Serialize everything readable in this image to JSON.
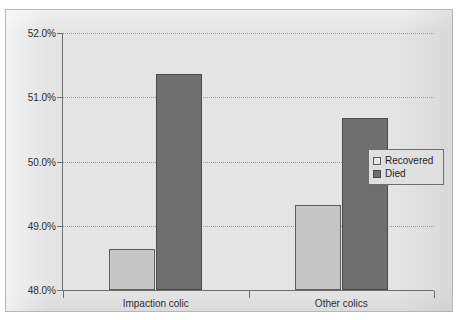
{
  "chart_data": {
    "type": "bar",
    "title": "",
    "subtitle": "",
    "xlabel": "",
    "ylabel": "",
    "categories": [
      "Impaction colic",
      "Other colics"
    ],
    "series": [
      {
        "name": "Recovered",
        "color": "#c6c6c6",
        "values": [
          48.64,
          49.32
        ]
      },
      {
        "name": "Died",
        "color": "#6f6f6f",
        "values": [
          51.36,
          50.68
        ]
      }
    ],
    "ylim": [
      48.0,
      52.0
    ],
    "ytick_step": 1.0,
    "ytick_labels": [
      "52.0%",
      "51.0%",
      "50.0%",
      "49.0%",
      "48.0%"
    ],
    "ytick_values": [
      52.0,
      51.0,
      50.0,
      49.0,
      48.0
    ],
    "grid": true,
    "grid_style": "dotted-horizontal",
    "legend_position": "right-middle",
    "value_suffix": "%"
  },
  "legend": {
    "entries": [
      {
        "label": "Recovered",
        "swatch": "recovered"
      },
      {
        "label": "Died",
        "swatch": "died"
      }
    ]
  },
  "axes": {
    "y_labels": [
      "52.0%",
      "51.0%",
      "50.0%",
      "49.0%",
      "48.0%"
    ],
    "x_labels": [
      "Impaction colic",
      "Other colics"
    ]
  },
  "colors": {
    "plot_background": "#e4e4e4",
    "frame_border": "#b6b6b6",
    "axis": "#6e6e6e",
    "gridline": "#9a9a9a",
    "recovered_bar": "#c6c6c6",
    "died_bar": "#6f6f6f",
    "text": "#2e2e2e"
  }
}
